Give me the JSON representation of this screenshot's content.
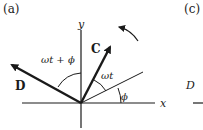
{
  "panels": [
    {
      "label": "(a)"
    },
    {
      "label": "(c)"
    }
  ],
  "diagram_a": {
    "axes": {
      "x_label": "x",
      "y_label": "y"
    },
    "vectors": [
      {
        "name": "C",
        "label": "C"
      },
      {
        "name": "D",
        "label": "D"
      }
    ],
    "angles": {
      "phi": "ϕ",
      "omega_t": "ωt",
      "omega_t_plus_phi": "ωt + ϕ"
    },
    "rotation": "counterclockwise"
  },
  "diagram_c": {
    "visible_label": "D"
  },
  "colors": {
    "ink": "#1a1a1a",
    "background": "#ffffff"
  }
}
